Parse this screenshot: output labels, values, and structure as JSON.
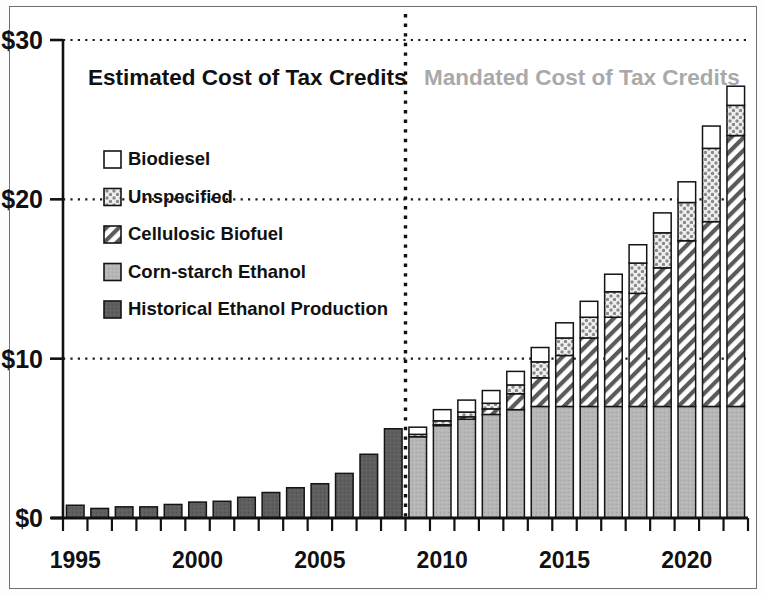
{
  "chart_data": {
    "type": "bar",
    "stacked": true,
    "title": "",
    "xlabel": "",
    "ylabel": "",
    "ylim": [
      0,
      30
    ],
    "ytick_labels": [
      "$0",
      "$10",
      "$20",
      "$30"
    ],
    "ytick_values": [
      0,
      10,
      20,
      30
    ],
    "xtick_labels": [
      "1995",
      "2000",
      "2005",
      "2010",
      "2015",
      "2020"
    ],
    "xtick_values": [
      1995,
      2000,
      2005,
      2010,
      2015,
      2020
    ],
    "grid": "horizontal-dotted",
    "legend_position": "upper-left-inside",
    "categories": [
      "1995",
      "1996",
      "1997",
      "1998",
      "1999",
      "2000",
      "2001",
      "2002",
      "2003",
      "2004",
      "2005",
      "2006",
      "2007",
      "2008",
      "2009",
      "2010",
      "2011",
      "2012",
      "2013",
      "2014",
      "2015",
      "2016",
      "2017",
      "2018",
      "2019",
      "2020",
      "2021",
      "2022"
    ],
    "series": [
      {
        "name": "Historical Ethanol Production",
        "fill": "solid-dark-gray",
        "color": "#595959",
        "values": [
          0.8,
          0.6,
          0.7,
          0.7,
          0.85,
          1.0,
          1.05,
          1.3,
          1.6,
          1.9,
          2.15,
          2.8,
          4.0,
          5.6,
          0,
          0,
          0,
          0,
          0,
          0,
          0,
          0,
          0,
          0,
          0,
          0,
          0,
          0
        ]
      },
      {
        "name": "Corn-starch Ethanol",
        "fill": "solid-light-gray",
        "color": "#b3b3b3",
        "values": [
          0,
          0,
          0,
          0,
          0,
          0,
          0,
          0,
          0,
          0,
          0,
          0,
          0,
          0,
          5.1,
          5.8,
          6.2,
          6.5,
          6.8,
          7.0,
          7.0,
          7.0,
          7.0,
          7.0,
          7.0,
          7.0,
          7.0,
          7.0
        ]
      },
      {
        "name": "Cellulosic Biofuel",
        "fill": "diagonal-hatch",
        "color": "#ffffff",
        "values": [
          0,
          0,
          0,
          0,
          0,
          0,
          0,
          0,
          0,
          0,
          0,
          0,
          0,
          0,
          0.0,
          0.05,
          0.15,
          0.35,
          1.0,
          1.8,
          3.2,
          4.3,
          5.6,
          7.1,
          8.7,
          10.4,
          11.6,
          17.0
        ]
      },
      {
        "name": "Unspecified",
        "fill": "dotted-gray",
        "color": "#c8c8c8",
        "values": [
          0,
          0,
          0,
          0,
          0,
          0,
          0,
          0,
          0,
          0,
          0,
          0,
          0,
          0,
          0.15,
          0.25,
          0.3,
          0.35,
          0.55,
          1.0,
          1.1,
          1.3,
          1.6,
          1.9,
          2.2,
          2.4,
          4.6,
          1.9
        ]
      },
      {
        "name": "Biodiesel",
        "fill": "white-open",
        "color": "#ffffff",
        "values": [
          0,
          0,
          0,
          0,
          0,
          0,
          0,
          0,
          0,
          0,
          0,
          0,
          0,
          0,
          0.45,
          0.7,
          0.75,
          0.8,
          0.85,
          0.9,
          0.95,
          1.0,
          1.1,
          1.15,
          1.25,
          1.3,
          1.4,
          1.2
        ]
      }
    ],
    "totals": [
      0.8,
      0.6,
      0.7,
      0.7,
      0.85,
      1.0,
      1.05,
      1.3,
      1.6,
      1.9,
      2.15,
      2.8,
      4.0,
      5.6,
      5.7,
      6.8,
      7.4,
      8.0,
      9.2,
      10.7,
      12.25,
      13.6,
      15.3,
      17.15,
      19.15,
      21.1,
      24.6,
      27.1
    ],
    "annotations": [
      {
        "text": "Estimated Cost of Tax Credits",
        "region": "left",
        "color": "#111111"
      },
      {
        "text": "Mandated Cost of Tax Credits",
        "region": "right",
        "color": "#a9a9a9"
      }
    ],
    "divider": {
      "type": "vertical-dotted",
      "at_year": 2008.5,
      "label": ""
    }
  },
  "legend": {
    "items": [
      {
        "label": "Biodiesel",
        "swatch": "white-open"
      },
      {
        "label": "Unspecified",
        "swatch": "dotted-gray"
      },
      {
        "label": "Cellulosic Biofuel",
        "swatch": "diagonal-hatch"
      },
      {
        "label": "Corn-starch Ethanol",
        "swatch": "solid-light-gray"
      },
      {
        "label": "Historical Ethanol Production",
        "swatch": "solid-dark-gray"
      }
    ]
  },
  "axes": {
    "y_ticks": [
      "$30",
      "$20",
      "$10",
      "$0"
    ],
    "x_ticks": [
      "1995",
      "2000",
      "2005",
      "2010",
      "2015",
      "2020"
    ]
  }
}
